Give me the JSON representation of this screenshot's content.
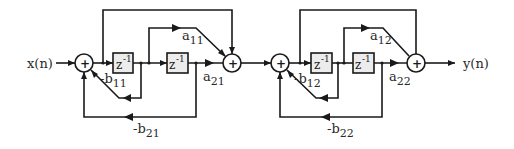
{
  "diagram": {
    "input_label": "x(n)",
    "output_label": "y(n)",
    "delay_label": "z",
    "delay_exponent": "-1",
    "sum_symbol": "+",
    "sections": [
      {
        "a1": {
          "base": "a",
          "sub": "11"
        },
        "a2": {
          "base": "a",
          "sub": "21"
        },
        "b1": {
          "base": "-b",
          "sub": "11"
        },
        "b2": {
          "base": "-b",
          "sub": "21"
        }
      },
      {
        "a1": {
          "base": "a",
          "sub": "12"
        },
        "a2": {
          "base": "a",
          "sub": "22"
        },
        "b1": {
          "base": "-b",
          "sub": "12"
        },
        "b2": {
          "base": "-b",
          "sub": "22"
        }
      }
    ]
  }
}
